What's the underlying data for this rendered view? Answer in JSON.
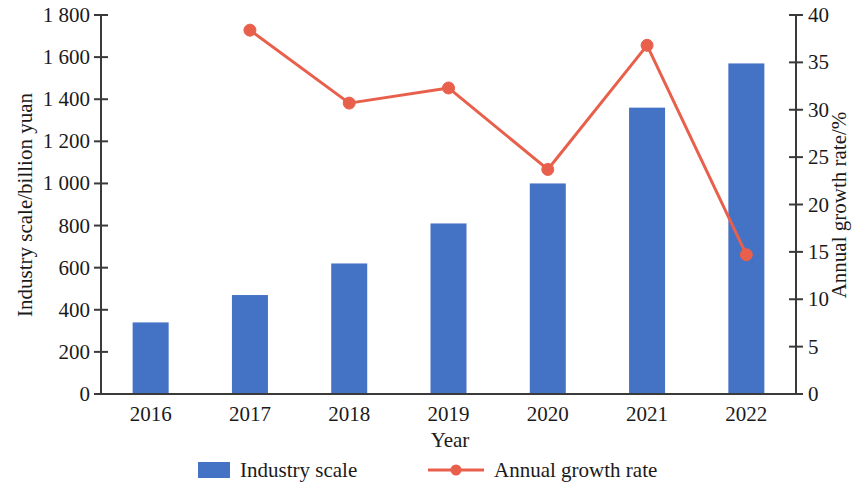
{
  "chart_data": {
    "type": "bar",
    "title": "",
    "subtitle": "",
    "xlabel": "Year",
    "ylabel": "Industry scale/billion yuan",
    "y2label": "Annual growth rate/%",
    "categories": [
      "2016",
      "2017",
      "2018",
      "2019",
      "2020",
      "2021",
      "2022"
    ],
    "ylim": [
      0,
      1800
    ],
    "y2lim": [
      0,
      40
    ],
    "yticks": [
      "0",
      "200",
      "400",
      "600",
      "800",
      "1 000",
      "1 200",
      "1 400",
      "1 600",
      "1 800"
    ],
    "ytick_values": [
      0,
      200,
      400,
      600,
      800,
      1000,
      1200,
      1400,
      1600,
      1800
    ],
    "y2ticks": [
      "0",
      "5",
      "10",
      "15",
      "20",
      "25",
      "30",
      "35",
      "40"
    ],
    "y2tick_values": [
      0,
      5,
      10,
      15,
      20,
      25,
      30,
      35,
      40
    ],
    "grid": false,
    "legend_position": "bottom",
    "series": [
      {
        "name": "Industry scale",
        "type": "bar",
        "axis": "left",
        "color": "#4472C4",
        "values": [
          340,
          470,
          620,
          810,
          1000,
          1360,
          1570
        ]
      },
      {
        "name": "Annual growth rate",
        "type": "line",
        "axis": "right",
        "color": "#E8604C",
        "marker": "circle",
        "values": [
          null,
          38.4,
          30.7,
          32.3,
          23.7,
          36.8,
          14.7
        ]
      }
    ]
  },
  "axes": {
    "left_title": "Industry scale/billion yuan",
    "right_title": "Annual growth rate/%",
    "bottom_title": "Year"
  },
  "legend": {
    "items": [
      {
        "label": "Industry scale",
        "marker": "bar-swatch",
        "color": "#4472C4"
      },
      {
        "label": "Annual growth rate",
        "marker": "line-dot",
        "color": "#E8604C"
      }
    ]
  }
}
